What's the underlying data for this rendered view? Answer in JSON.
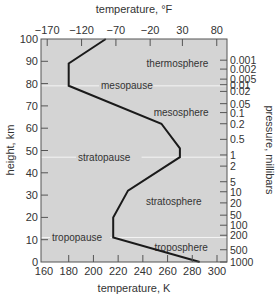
{
  "chart_data": {
    "type": "line",
    "title": "",
    "xlabel": "temperature, K",
    "x2label": "temperature, °F",
    "ylabel": "height, km",
    "y2label": "pressure, millibars",
    "xlim": [
      160,
      300
    ],
    "ylim": [
      0,
      100
    ],
    "x_ticks": [
      160,
      180,
      200,
      220,
      240,
      260,
      280,
      300
    ],
    "x2_ticks": [
      {
        "label": "−170",
        "kelvin": 162.6
      },
      {
        "label": "−120",
        "kelvin": 190.4
      },
      {
        "label": "−70",
        "kelvin": 218.2
      },
      {
        "label": "−20",
        "kelvin": 245.9
      },
      {
        "label": "30",
        "kelvin": 272.0
      },
      {
        "label": "80",
        "kelvin": 299.8
      }
    ],
    "y_ticks": [
      0,
      10,
      20,
      30,
      40,
      50,
      60,
      70,
      80,
      90,
      100
    ],
    "y2_ticks": [
      {
        "label": "0.001",
        "km": 90.5
      },
      {
        "label": "0.002",
        "km": 86.5
      },
      {
        "label": "0.005",
        "km": 82.0
      },
      {
        "label": "0.01",
        "km": 79.5
      },
      {
        "label": "0.02",
        "km": 76.5
      },
      {
        "label": "0.05",
        "km": 71.0
      },
      {
        "label": "0.1",
        "km": 67.0
      },
      {
        "label": "0.2",
        "km": 62.0
      },
      {
        "label": "0.5",
        "km": 55.0
      },
      {
        "label": "1",
        "km": 48.0
      },
      {
        "label": "2",
        "km": 43.0
      },
      {
        "label": "5",
        "km": 36.0
      },
      {
        "label": "10",
        "km": 31.5
      },
      {
        "label": "20",
        "km": 26.5
      },
      {
        "label": "50",
        "km": 21.0
      },
      {
        "label": "100",
        "km": 16.5
      },
      {
        "label": "200",
        "km": 12.0
      },
      {
        "label": "500",
        "km": 5.5
      },
      {
        "label": "1000",
        "km": 0
      }
    ],
    "series": [
      {
        "name": "temperature profile",
        "x": [
          286,
          216,
          216,
          228,
          270,
          270,
          255,
          180,
          180,
          210
        ],
        "y": [
          0,
          11,
          20,
          32,
          47,
          51,
          62,
          79,
          89,
          100
        ]
      }
    ],
    "boundaries": [
      {
        "label": "tropopause",
        "km": 11
      },
      {
        "label": "stratopause",
        "km": 47
      },
      {
        "label": "mesopause",
        "km": 79
      }
    ],
    "layer_labels": [
      {
        "label": "troposphere",
        "kelvin": 271,
        "km": 6.5
      },
      {
        "label": "stratosphere",
        "kelvin": 265,
        "km": 27
      },
      {
        "label": "mesosphere",
        "kelvin": 271,
        "km": 67
      },
      {
        "label": "thermosphere",
        "kelvin": 268,
        "km": 89
      }
    ],
    "grid": false,
    "colors": {
      "plot_bg": "#d4d4d4",
      "line": "#1a1a1a",
      "boundary": "#f4f4f4",
      "frame": "#555555",
      "text": "#333333"
    }
  }
}
